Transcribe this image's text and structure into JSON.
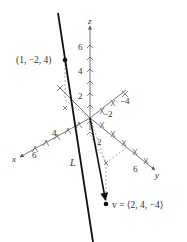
{
  "figure": {
    "axes": {
      "x_label": "x",
      "y_label": "y",
      "z_label": "z",
      "x_ticks": [
        "4",
        "6"
      ],
      "y_ticks": [
        "2",
        "6"
      ],
      "y_neg_ticks": [
        "−2",
        "−4"
      ],
      "z_ticks": [
        "2",
        "4",
        "6"
      ]
    },
    "point": {
      "label": "(1, −2, 4)",
      "coords": [
        1,
        -2,
        4
      ]
    },
    "vector": {
      "label": "v = ⟨2, 4, −4⟩",
      "components": [
        2,
        4,
        -4
      ]
    },
    "line": {
      "label": "L"
    },
    "colors": {
      "line": "#111111",
      "axes": "#555555",
      "text": "#333333"
    }
  }
}
